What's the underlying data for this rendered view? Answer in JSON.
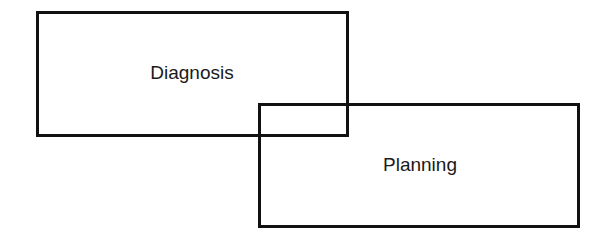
{
  "diagram": {
    "type": "overlapping-boxes",
    "boxes": [
      {
        "label": "Diagnosis"
      },
      {
        "label": "Planning"
      }
    ],
    "colors": {
      "stroke": "#111111",
      "text": "#1a1a1a",
      "background": "#ffffff"
    }
  }
}
